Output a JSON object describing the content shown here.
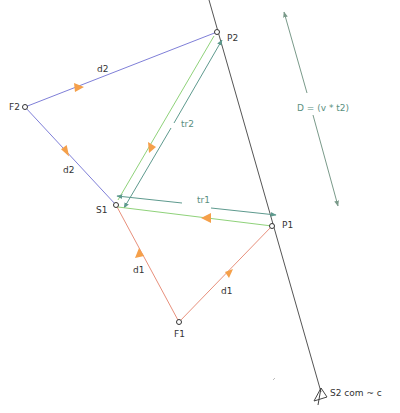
{
  "colors": {
    "d1_line": "#e8907c",
    "d2_line": "#7f7fd8",
    "tr_green": "#8fd27a",
    "tr_teal": "#5e9a8e",
    "axis_line": "#555555",
    "arrowhead": "#f5a04a",
    "D_arrow": "#7a9a8a"
  },
  "points": {
    "P2": {
      "label": "P2",
      "x": 217,
      "y": 32
    },
    "F2": {
      "label": "F2",
      "x": 25,
      "y": 107
    },
    "S1": {
      "label": "S1",
      "x": 116,
      "y": 205
    },
    "P1": {
      "label": "P1",
      "x": 272,
      "y": 226
    },
    "F1": {
      "label": "F1",
      "x": 179,
      "y": 322
    },
    "S2": {
      "label": "S2 com ~ c",
      "x": 320,
      "y": 392
    }
  },
  "segment_labels": {
    "d2_top": "d2",
    "d2_left": "d2",
    "d1_left": "d1",
    "d1_right": "d1",
    "tr1": "tr1",
    "tr2": "tr2"
  },
  "annotation": {
    "D_formula": "D = (v * t2)"
  }
}
